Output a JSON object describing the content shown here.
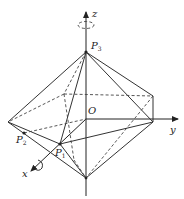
{
  "figure": {
    "type": "3d-octahedron-rotation-diagram",
    "axes": {
      "x": {
        "label": "x"
      },
      "y": {
        "label": "y"
      },
      "z": {
        "label": "z"
      }
    },
    "origin": {
      "label": "O"
    },
    "points": [
      {
        "id": "P1",
        "label": "P",
        "sub": "1"
      },
      {
        "id": "P2",
        "label": "P",
        "sub": "2"
      },
      {
        "id": "P3",
        "label": "P",
        "sub": "3"
      }
    ],
    "rotation_symbols": [
      "rotation-about-z",
      "rotation-about-x"
    ],
    "colors": {
      "line": "#333333",
      "background": "#ffffff"
    }
  }
}
